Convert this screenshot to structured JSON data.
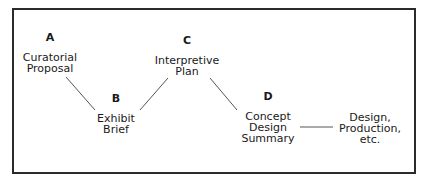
{
  "diagram": {
    "nodes": [
      {
        "letter": "A",
        "label_lines": [
          "Curatorial",
          "Proposal"
        ]
      },
      {
        "letter": "B",
        "label_lines": [
          "Exhibit",
          "Brief"
        ]
      },
      {
        "letter": "C",
        "label_lines": [
          "Interpretive",
          "Plan"
        ]
      },
      {
        "letter": "D",
        "label_lines": [
          "Concept",
          "Design",
          "Summary"
        ]
      },
      {
        "letter": "",
        "label_lines": [
          "Design,",
          "Production,",
          "etc."
        ]
      }
    ],
    "edges": [
      {
        "from": "A",
        "to": "B"
      },
      {
        "from": "B",
        "to": "C"
      },
      {
        "from": "C",
        "to": "D"
      },
      {
        "from": "D",
        "to": "Design, Production, etc."
      }
    ]
  }
}
